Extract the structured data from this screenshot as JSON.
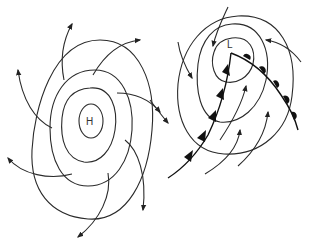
{
  "diagram": {
    "high_system": {
      "center_label": "H",
      "type": "anticyclone",
      "isobar_count": 4,
      "wind_direction": "outward-clockwise"
    },
    "low_system": {
      "center_label": "L",
      "type": "cyclone",
      "isobar_count": 3,
      "wind_direction": "inward-counterclockwise",
      "fronts": [
        "cold-front",
        "warm-front"
      ]
    }
  },
  "colors": {
    "line": "#2a2a2a",
    "background": "#ffffff"
  }
}
